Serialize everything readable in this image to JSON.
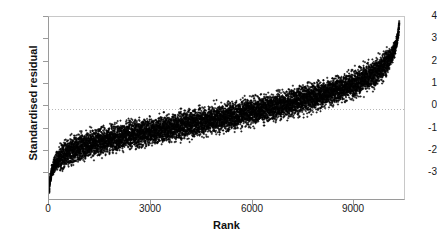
{
  "chart_data": {
    "type": "scatter",
    "title": "",
    "xlabel": "Rank",
    "ylabel": "Standardised residual",
    "xlim": [
      0,
      10500
    ],
    "ylim": [
      -4,
      4
    ],
    "xticks": [
      0,
      3000,
      6000,
      9000
    ],
    "xtick_labels": [
      "0",
      "3000",
      "6000",
      "9000"
    ],
    "yticks": [
      4,
      3,
      2,
      1,
      0,
      -1,
      -2,
      -3
    ],
    "ytick_labels": [
      "4",
      "3",
      "2",
      "1",
      "0",
      "-1",
      "-2",
      "-3"
    ],
    "grid": false,
    "zero_reference_line": 0,
    "zero_line_style": "dotted",
    "marker": "plus",
    "marker_color": "#000000",
    "n_points": 10300,
    "series": [
      {
        "name": "Standardised residual (sorted by rank)",
        "description": "Ogive of sorted standardised residuals; dense black band of ~10300 points rising monotonically from about -3.6 at rank 1 to about +3.8 at rank 10300, crossing zero near rank 5100.",
        "x_min": 1,
        "x_max": 10300,
        "y_min": -3.65,
        "y_max": 3.8,
        "quantile_points": [
          {
            "rank": 1,
            "value": -3.62
          },
          {
            "rank": 30,
            "value": -3.05
          },
          {
            "rank": 80,
            "value": -2.7
          },
          {
            "rank": 150,
            "value": -2.45
          },
          {
            "rank": 300,
            "value": -2.15
          },
          {
            "rank": 500,
            "value": -1.95
          },
          {
            "rank": 800,
            "value": -1.72
          },
          {
            "rank": 1200,
            "value": -1.52
          },
          {
            "rank": 1800,
            "value": -1.3
          },
          {
            "rank": 2500,
            "value": -1.1
          },
          {
            "rank": 3000,
            "value": -0.98
          },
          {
            "rank": 4000,
            "value": -0.7
          },
          {
            "rank": 5000,
            "value": -0.4
          },
          {
            "rank": 5100,
            "value": -0.38
          },
          {
            "rank": 6000,
            "value": -0.1
          },
          {
            "rank": 7000,
            "value": 0.22
          },
          {
            "rank": 8000,
            "value": 0.62
          },
          {
            "rank": 8800,
            "value": 1.0
          },
          {
            "rank": 9400,
            "value": 1.38
          },
          {
            "rank": 9800,
            "value": 1.8
          },
          {
            "rank": 10050,
            "value": 2.25
          },
          {
            "rank": 10200,
            "value": 2.75
          },
          {
            "rank": 10280,
            "value": 3.3
          },
          {
            "rank": 10300,
            "value": 3.78
          }
        ],
        "band_halfwidth": 0.42
      }
    ],
    "colors": {
      "data": "#000000",
      "axis": "#9a9a9a",
      "frame": "#c8c8c8",
      "text": "#1a1a1a",
      "zero_line": "#b9b9b9",
      "background": "#ffffff"
    }
  }
}
